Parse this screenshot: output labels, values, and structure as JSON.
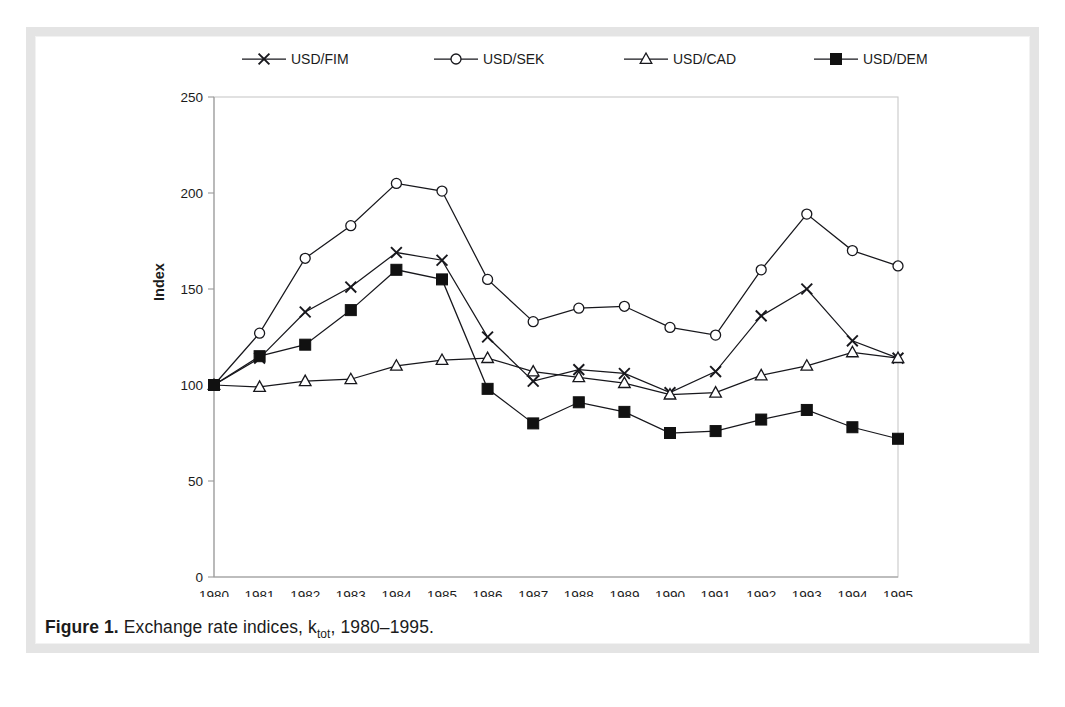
{
  "figure": {
    "caption_label": "Figure 1.",
    "caption_text": "Exchange rate indices, k",
    "caption_sub": "tot",
    "caption_tail": ", 1980–1995."
  },
  "chart_data": {
    "type": "line",
    "title": "",
    "xlabel": "",
    "ylabel": "Index",
    "x": [
      1980,
      1981,
      1982,
      1983,
      1984,
      1985,
      1986,
      1987,
      1988,
      1989,
      1990,
      1991,
      1992,
      1993,
      1994,
      1995
    ],
    "xtick_labels": [
      "1980",
      "1981",
      "1982",
      "1983",
      "1984",
      "1985",
      "1986",
      "1987",
      "1988",
      "1989",
      "1990",
      "1991",
      "1992",
      "1993",
      "1994",
      "1995"
    ],
    "ylim": [
      0,
      250
    ],
    "yticks": [
      0,
      50,
      100,
      150,
      200,
      250
    ],
    "ytick_labels": [
      "0",
      "50",
      "100",
      "150",
      "200",
      "250"
    ],
    "grid": false,
    "legend_position": "top",
    "series": [
      {
        "name": "USD/FIM",
        "marker": "x",
        "values": [
          100,
          114,
          138,
          151,
          169,
          165,
          125,
          102,
          108,
          106,
          96,
          107,
          136,
          150,
          123,
          114
        ]
      },
      {
        "name": "USD/SEK",
        "marker": "circle",
        "values": [
          100,
          127,
          166,
          183,
          205,
          201,
          155,
          133,
          140,
          141,
          130,
          126,
          160,
          189,
          170,
          162
        ]
      },
      {
        "name": "USD/CAD",
        "marker": "triangle",
        "values": [
          100,
          99,
          102,
          103,
          110,
          113,
          114,
          107,
          104,
          101,
          95,
          96,
          105,
          110,
          117,
          114
        ]
      },
      {
        "name": "USD/DEM",
        "marker": "square",
        "values": [
          100,
          115,
          121,
          139,
          160,
          155,
          98,
          80,
          91,
          86,
          75,
          76,
          82,
          87,
          78,
          72
        ]
      }
    ]
  }
}
